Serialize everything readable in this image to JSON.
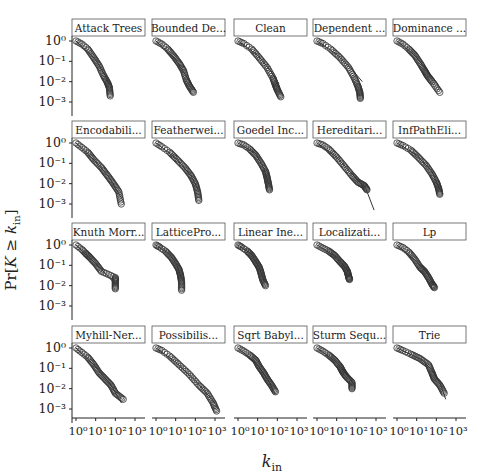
{
  "chart_data": {
    "type": "scatter",
    "title": "",
    "xlabel": "k_in",
    "ylabel": "Pr[K ≥ k_in]",
    "xscale": "log",
    "yscale": "log",
    "xlim": [
      1,
      1000
    ],
    "ylim": [
      0.001,
      1
    ],
    "x_tick_labels": [
      "10^0",
      "10^1",
      "10^2",
      "10^3"
    ],
    "y_tick_labels": [
      "10^0",
      "10^-1",
      "10^-2",
      "10^-3"
    ],
    "grid": false,
    "layout": {
      "rows": 4,
      "cols": 5
    },
    "marker": "open-circle",
    "fit_line": true,
    "panels": [
      {
        "title": "Attack Trees",
        "points": [
          [
            1,
            1
          ],
          [
            2,
            0.7
          ],
          [
            4,
            0.4
          ],
          [
            8,
            0.15
          ],
          [
            15,
            0.06
          ],
          [
            25,
            0.02
          ],
          [
            40,
            0.009
          ],
          [
            50,
            0.005
          ],
          [
            55,
            0.002
          ]
        ],
        "fit": [
          [
            1,
            1
          ],
          [
            10,
            0.12
          ],
          [
            30,
            0.02
          ],
          [
            50,
            0.007
          ]
        ]
      },
      {
        "title": "Bounded De...",
        "points": [
          [
            1,
            1
          ],
          [
            2,
            0.7
          ],
          [
            4,
            0.4
          ],
          [
            8,
            0.18
          ],
          [
            15,
            0.08
          ],
          [
            25,
            0.035
          ],
          [
            35,
            0.012
          ],
          [
            50,
            0.006
          ],
          [
            80,
            0.003
          ]
        ],
        "fit": [
          [
            1,
            1
          ],
          [
            10,
            0.12
          ],
          [
            40,
            0.015
          ],
          [
            100,
            0.004
          ]
        ]
      },
      {
        "title": "Clean",
        "points": [
          [
            1,
            1
          ],
          [
            2,
            0.75
          ],
          [
            5,
            0.4
          ],
          [
            12,
            0.15
          ],
          [
            30,
            0.05
          ],
          [
            60,
            0.015
          ],
          [
            80,
            0.007
          ],
          [
            100,
            0.004
          ],
          [
            150,
            0.0018
          ]
        ],
        "fit": [
          [
            1,
            1
          ],
          [
            10,
            0.2
          ],
          [
            50,
            0.03
          ],
          [
            120,
            0.008
          ]
        ]
      },
      {
        "title": "Dependent ...",
        "points": [
          [
            1,
            1
          ],
          [
            2,
            0.75
          ],
          [
            5,
            0.4
          ],
          [
            15,
            0.15
          ],
          [
            40,
            0.05
          ],
          [
            80,
            0.015
          ],
          [
            120,
            0.006
          ],
          [
            150,
            0.003
          ],
          [
            160,
            0.0015
          ]
        ],
        "fit": [
          [
            1,
            1
          ],
          [
            10,
            0.22
          ],
          [
            60,
            0.04
          ],
          [
            200,
            0.01
          ]
        ]
      },
      {
        "title": "Dominance ...",
        "points": [
          [
            1,
            1
          ],
          [
            2,
            0.7
          ],
          [
            4,
            0.4
          ],
          [
            8,
            0.2
          ],
          [
            15,
            0.08
          ],
          [
            25,
            0.035
          ],
          [
            35,
            0.02
          ],
          [
            60,
            0.01
          ],
          [
            150,
            0.003
          ]
        ],
        "fit": [
          [
            1,
            1
          ],
          [
            8,
            0.2
          ],
          [
            30,
            0.04
          ],
          [
            100,
            0.01
          ],
          [
            170,
            0.004
          ]
        ]
      },
      {
        "title": "Encodabili...",
        "points": [
          [
            1,
            1
          ],
          [
            2,
            0.6
          ],
          [
            4,
            0.35
          ],
          [
            8,
            0.15
          ],
          [
            20,
            0.06
          ],
          [
            40,
            0.025
          ],
          [
            80,
            0.01
          ],
          [
            150,
            0.004
          ],
          [
            200,
            0.001
          ]
        ],
        "fit": [
          [
            1,
            1
          ],
          [
            10,
            0.12
          ],
          [
            50,
            0.02
          ],
          [
            200,
            0.002
          ]
        ]
      },
      {
        "title": "Featherwei...",
        "points": [
          [
            1,
            1
          ],
          [
            2,
            0.65
          ],
          [
            5,
            0.35
          ],
          [
            12,
            0.15
          ],
          [
            30,
            0.06
          ],
          [
            60,
            0.025
          ],
          [
            100,
            0.01
          ],
          [
            130,
            0.004
          ],
          [
            150,
            0.0015
          ]
        ],
        "fit": [
          [
            1,
            1
          ],
          [
            10,
            0.18
          ],
          [
            60,
            0.025
          ],
          [
            140,
            0.005
          ]
        ]
      },
      {
        "title": "Goedel Inc...",
        "points": [
          [
            1,
            1
          ],
          [
            2,
            0.8
          ],
          [
            4,
            0.5
          ],
          [
            8,
            0.25
          ],
          [
            15,
            0.1
          ],
          [
            25,
            0.04
          ],
          [
            30,
            0.02
          ],
          [
            35,
            0.01
          ],
          [
            40,
            0.005
          ]
        ],
        "fit": [
          [
            1,
            1
          ],
          [
            8,
            0.3
          ],
          [
            20,
            0.06
          ],
          [
            35,
            0.01
          ]
        ]
      },
      {
        "title": "Hereditari...",
        "points": [
          [
            1,
            1
          ],
          [
            2,
            0.8
          ],
          [
            4,
            0.5
          ],
          [
            10,
            0.2
          ],
          [
            25,
            0.07
          ],
          [
            60,
            0.025
          ],
          [
            120,
            0.012
          ],
          [
            250,
            0.008
          ],
          [
            350,
            0.005
          ]
        ],
        "fit": [
          [
            1,
            1
          ],
          [
            10,
            0.2
          ],
          [
            60,
            0.03
          ],
          [
            300,
            0.006
          ],
          [
            800,
            0.0005
          ]
        ]
      },
      {
        "title": "InfPathEli...",
        "points": [
          [
            1,
            1
          ],
          [
            2,
            0.75
          ],
          [
            5,
            0.45
          ],
          [
            12,
            0.2
          ],
          [
            30,
            0.08
          ],
          [
            60,
            0.03
          ],
          [
            100,
            0.012
          ],
          [
            130,
            0.006
          ],
          [
            150,
            0.003
          ]
        ],
        "fit": [
          [
            1,
            1
          ],
          [
            10,
            0.25
          ],
          [
            60,
            0.04
          ],
          [
            150,
            0.005
          ]
        ]
      },
      {
        "title": "Knuth Morr...",
        "points": [
          [
            1,
            1
          ],
          [
            2,
            0.6
          ],
          [
            3,
            0.4
          ],
          [
            5,
            0.25
          ],
          [
            10,
            0.12
          ],
          [
            20,
            0.05
          ],
          [
            100,
            0.025
          ],
          [
            100,
            0.015
          ],
          [
            100,
            0.007
          ]
        ],
        "fit": [
          [
            1,
            1
          ],
          [
            10,
            0.12
          ],
          [
            100,
            0.012
          ]
        ]
      },
      {
        "title": "LatticePro...",
        "points": [
          [
            1,
            1
          ],
          [
            1.5,
            0.8
          ],
          [
            3,
            0.5
          ],
          [
            6,
            0.25
          ],
          [
            10,
            0.12
          ],
          [
            15,
            0.06
          ],
          [
            18,
            0.03
          ],
          [
            20,
            0.015
          ],
          [
            20,
            0.006
          ]
        ],
        "fit": [
          [
            1,
            1
          ],
          [
            5,
            0.35
          ],
          [
            12,
            0.1
          ],
          [
            20,
            0.02
          ]
        ]
      },
      {
        "title": "Linear Ine...",
        "points": [
          [
            1,
            1
          ],
          [
            1.5,
            0.8
          ],
          [
            3,
            0.5
          ],
          [
            5,
            0.3
          ],
          [
            8,
            0.15
          ],
          [
            12,
            0.08
          ],
          [
            15,
            0.04
          ],
          [
            18,
            0.02
          ],
          [
            25,
            0.01
          ]
        ],
        "fit": [
          [
            1,
            1
          ],
          [
            5,
            0.35
          ],
          [
            12,
            0.08
          ],
          [
            22,
            0.015
          ]
        ]
      },
      {
        "title": "Localizati...",
        "points": [
          [
            1,
            1
          ],
          [
            2,
            0.7
          ],
          [
            4,
            0.5
          ],
          [
            8,
            0.3
          ],
          [
            15,
            0.15
          ],
          [
            25,
            0.09
          ],
          [
            35,
            0.05
          ],
          [
            40,
            0.03
          ],
          [
            45,
            0.02
          ]
        ],
        "fit": [
          [
            1,
            1
          ],
          [
            10,
            0.25
          ],
          [
            40,
            0.05
          ]
        ]
      },
      {
        "title": "Lp",
        "points": [
          [
            1,
            1
          ],
          [
            2,
            0.75
          ],
          [
            4,
            0.45
          ],
          [
            8,
            0.2
          ],
          [
            15,
            0.08
          ],
          [
            25,
            0.05
          ],
          [
            40,
            0.025
          ],
          [
            60,
            0.012
          ],
          [
            80,
            0.008
          ]
        ],
        "fit": [
          [
            1,
            1
          ],
          [
            10,
            0.15
          ],
          [
            30,
            0.05
          ],
          [
            80,
            0.01
          ]
        ]
      },
      {
        "title": "Myhill-Ner...",
        "points": [
          [
            1,
            1
          ],
          [
            2,
            0.6
          ],
          [
            4,
            0.35
          ],
          [
            8,
            0.15
          ],
          [
            15,
            0.06
          ],
          [
            30,
            0.03
          ],
          [
            60,
            0.015
          ],
          [
            100,
            0.006
          ],
          [
            250,
            0.003
          ]
        ],
        "fit": [
          [
            1,
            1
          ],
          [
            10,
            0.12
          ],
          [
            60,
            0.015
          ],
          [
            200,
            0.002
          ]
        ]
      },
      {
        "title": "Possibilis...",
        "points": [
          [
            1,
            1
          ],
          [
            2,
            0.75
          ],
          [
            5,
            0.4
          ],
          [
            15,
            0.15
          ],
          [
            50,
            0.05
          ],
          [
            150,
            0.015
          ],
          [
            400,
            0.006
          ],
          [
            800,
            0.002
          ],
          [
            1200,
            0.0008
          ]
        ],
        "fit": [
          [
            1,
            1
          ],
          [
            10,
            0.2
          ],
          [
            100,
            0.025
          ],
          [
            1000,
            0.002
          ]
        ]
      },
      {
        "title": "Sqrt Babyl...",
        "points": [
          [
            1,
            1
          ],
          [
            2,
            0.7
          ],
          [
            4,
            0.45
          ],
          [
            8,
            0.25
          ],
          [
            12,
            0.12
          ],
          [
            20,
            0.06
          ],
          [
            30,
            0.03
          ],
          [
            50,
            0.015
          ],
          [
            80,
            0.007
          ]
        ],
        "fit": [
          [
            1,
            1
          ],
          [
            10,
            0.15
          ],
          [
            40,
            0.02
          ],
          [
            80,
            0.005
          ]
        ]
      },
      {
        "title": "Sturm Sequ...",
        "points": [
          [
            1,
            1
          ],
          [
            2,
            0.7
          ],
          [
            4,
            0.45
          ],
          [
            8,
            0.25
          ],
          [
            15,
            0.12
          ],
          [
            20,
            0.07
          ],
          [
            30,
            0.04
          ],
          [
            60,
            0.02
          ],
          [
            60,
            0.01
          ]
        ],
        "fit": [
          [
            1,
            1
          ],
          [
            10,
            0.2
          ],
          [
            40,
            0.04
          ],
          [
            80,
            0.015
          ]
        ]
      },
      {
        "title": "Trie",
        "points": [
          [
            1,
            1
          ],
          [
            2,
            0.75
          ],
          [
            5,
            0.5
          ],
          [
            15,
            0.3
          ],
          [
            40,
            0.15
          ],
          [
            60,
            0.06
          ],
          [
            80,
            0.03
          ],
          [
            150,
            0.015
          ],
          [
            250,
            0.006
          ]
        ],
        "fit": [
          [
            1,
            1
          ],
          [
            20,
            0.25
          ],
          [
            60,
            0.08
          ],
          [
            150,
            0.02
          ],
          [
            300,
            0.003
          ]
        ]
      }
    ]
  },
  "labels": {
    "ylabel_prefix": "Pr[",
    "ylabel_K": "K",
    "ylabel_ge": " ≥ ",
    "ylabel_k": "k",
    "ylabel_sub": "in",
    "ylabel_suffix": "]",
    "xlabel_k": "k",
    "xlabel_sub": "in"
  },
  "style": {
    "marker_stroke": "#333333",
    "line_color": "#333333",
    "axis_color": "#222222",
    "title_box_border": "#555555"
  }
}
